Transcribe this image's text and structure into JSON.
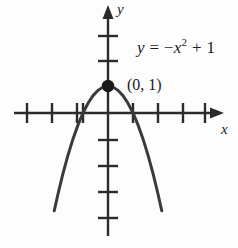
{
  "figure": {
    "width": 238,
    "height": 248,
    "background_color": "#fdfdfd",
    "ink_color": "#2b2b2b",
    "text_color": "#1c1c1c"
  },
  "labels": {
    "y_axis": "y",
    "x_axis": "x",
    "point": "(0, 1)",
    "equation_lhs": "y",
    "equation_eq": " = ",
    "equation_minus": "−",
    "equation_x": "x",
    "equation_exponent": "2",
    "equation_plus": " + 1",
    "equation_full": "y = −x² + 1"
  },
  "chart_data": {
    "type": "line",
    "title": "",
    "subtitle": "",
    "xlabel": "x",
    "ylabel": "y",
    "equation": "y = -x^2 + 1",
    "grid": false,
    "legend": null,
    "xlim": [
      -4.2,
      4.2
    ],
    "ylim": [
      -4.6,
      3.4
    ],
    "x_ticks": [
      -4,
      -3,
      -2,
      -1,
      1,
      2,
      3,
      4
    ],
    "y_ticks": [
      -4,
      -3,
      -2,
      -1,
      2,
      3
    ],
    "x_tick_labels": [],
    "y_tick_labels": [],
    "axes_arrows": [
      "x-positive",
      "y-positive"
    ],
    "series": [
      {
        "name": "y = -x^2 + 1",
        "x": [
          -2.15,
          -2.0,
          -1.8,
          -1.6,
          -1.4,
          -1.2,
          -1.0,
          -0.8,
          -0.6,
          -0.4,
          -0.2,
          0.0,
          0.2,
          0.4,
          0.6,
          0.8,
          1.0,
          1.2,
          1.4,
          1.6,
          1.8,
          2.0,
          2.15
        ],
        "y": [
          -3.62,
          -3.0,
          -2.24,
          -1.56,
          -0.96,
          -0.44,
          0.0,
          0.36,
          0.64,
          0.84,
          0.96,
          1.0,
          0.96,
          0.84,
          0.64,
          0.36,
          0.0,
          -0.44,
          -0.96,
          -1.56,
          -2.24,
          -3.0,
          -3.62
        ]
      }
    ],
    "annotations": [
      {
        "name": "vertex",
        "x": 0,
        "y": 1,
        "label": "(0, 1)",
        "marker": "filled-circle"
      },
      {
        "name": "equation-text",
        "x": 1.6,
        "y": 2.6,
        "label": "y = −x² + 1"
      }
    ],
    "x_intercepts": [
      -1,
      1
    ],
    "y_intercept": 1,
    "vertex": [
      0,
      1
    ],
    "opens": "down"
  }
}
